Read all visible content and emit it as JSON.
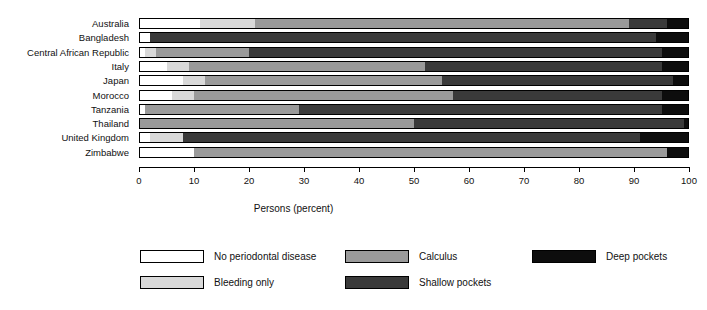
{
  "chart_data": {
    "type": "bar",
    "orientation": "horizontal",
    "stacked": true,
    "title": "",
    "xlabel": "Persons (percent)",
    "ylabel": "",
    "xlim": [
      0,
      100
    ],
    "xticks": [
      0,
      10,
      20,
      30,
      40,
      50,
      60,
      70,
      80,
      90,
      100
    ],
    "xticklabels": [
      "0",
      "10",
      "20",
      "30",
      "40",
      "50",
      "60",
      "70",
      "80",
      "90",
      "100"
    ],
    "grid": false,
    "legend_position": "bottom",
    "categories": [
      "Australia",
      "Bangladesh",
      "Central African Republic",
      "Italy",
      "Japan",
      "Morocco",
      "Tanzania",
      "Thailand",
      "United Kingdom",
      "Zimbabwe"
    ],
    "series": [
      {
        "name": "No periodontal disease",
        "color": "#ffffff",
        "values": [
          11,
          2,
          1,
          5,
          8,
          6,
          1,
          0,
          2,
          10
        ]
      },
      {
        "name": "Bleeding only",
        "color": "#d9d9d9",
        "values": [
          10,
          0,
          2,
          4,
          4,
          4,
          0,
          0,
          6,
          0
        ]
      },
      {
        "name": "Calculus",
        "color": "#9a9a9a",
        "values": [
          68,
          0,
          17,
          43,
          43,
          47,
          28,
          50,
          0,
          86
        ]
      },
      {
        "name": "Shallow pockets",
        "color": "#3a3a3a",
        "values": [
          7,
          92,
          75,
          43,
          42,
          38,
          66,
          49,
          83,
          0
        ]
      },
      {
        "name": "Deep pockets",
        "color": "#0d0d0d",
        "values": [
          4,
          6,
          5,
          5,
          3,
          5,
          5,
          1,
          9,
          4
        ]
      }
    ]
  },
  "legend": {
    "items": [
      {
        "label": "No periodontal disease",
        "color": "#ffffff"
      },
      {
        "label": "Bleeding only",
        "color": "#d9d9d9"
      },
      {
        "label": "Calculus",
        "color": "#9a9a9a"
      },
      {
        "label": "Shallow pockets",
        "color": "#3a3a3a"
      },
      {
        "label": "Deep pockets",
        "color": "#0d0d0d"
      }
    ]
  }
}
